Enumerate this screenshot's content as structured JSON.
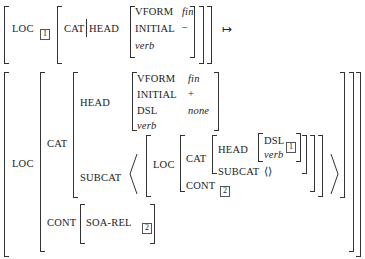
{
  "rule": {
    "input": {
      "loc_label": "LOC",
      "loc_tag": "1",
      "cat_label": "CAT",
      "head_label": "HEAD",
      "head": {
        "vform_label": "VFORM",
        "vform_value": "fin",
        "initial_label": "INITIAL",
        "initial_value": "−",
        "type": "verb"
      }
    },
    "arrow": "↦",
    "output": {
      "loc_label": "LOC",
      "cat_label": "CAT",
      "head_label": "HEAD",
      "head": {
        "vform_label": "VFORM",
        "vform_value": "fin",
        "initial_label": "INITIAL",
        "initial_value": "+",
        "dsl_label": "DSL",
        "dsl_value": "none",
        "type": "verb"
      },
      "subcat_label": "SUBCAT",
      "subcat_item": {
        "loc_label": "LOC",
        "cat_label": "CAT",
        "head_label": "HEAD",
        "dsl_label": "DSL",
        "dsl_tag": "1",
        "type": "verb",
        "subcat_label": "SUBCAT",
        "subcat_value": "⟨⟩",
        "cont_label": "CONT",
        "cont_tag": "2"
      },
      "cont_label": "CONT",
      "soa_rel_label": "SOA-REL",
      "soa_rel_tag": "2"
    }
  }
}
